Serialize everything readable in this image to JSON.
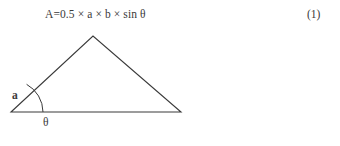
{
  "page": {
    "background_color": "#ffffff",
    "ink_color": "#3a3a3a"
  },
  "equation": {
    "formula": "A=0.5 × a × b × sin θ",
    "number": "(1)"
  },
  "figure": {
    "caption_labels": {
      "side_a": "a",
      "side_b": "b",
      "angle": "θ"
    },
    "geometry": {
      "type": "triangle",
      "stroke_color": "#3a3a3a",
      "fill": "none",
      "vertices": {
        "left": [
          11,
          87
        ],
        "apex": [
          93,
          11
        ],
        "right": [
          181,
          87
        ]
      },
      "angle_arc": {
        "center": [
          11,
          87
        ],
        "radius": 32,
        "from_label": "base",
        "to_label": "side-a"
      }
    }
  }
}
